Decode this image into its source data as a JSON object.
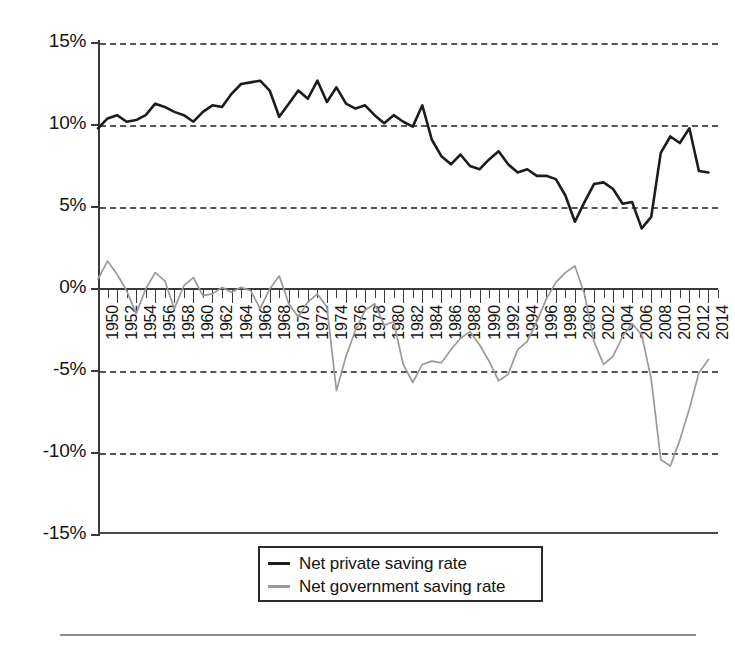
{
  "chart_data": {
    "type": "line",
    "title": "",
    "subtitle": "",
    "xlabel": "",
    "ylabel": "",
    "xlim": [
      1950,
      2015
    ],
    "ylim": [
      -15,
      15
    ],
    "y_tick_labels": [
      "15%",
      "10%",
      "5%",
      "0%",
      "-5%",
      "-10%",
      "-15%"
    ],
    "y_tick_values": [
      15,
      10,
      5,
      0,
      -5,
      -10,
      -15
    ],
    "grid": "horizontal-dashed",
    "gridlines_at": [
      15,
      10,
      5,
      -5,
      -10
    ],
    "zero_axis": 0,
    "legend_position": "below-center",
    "x_tick_labels": [
      "1950",
      "1952",
      "1954",
      "1956",
      "1958",
      "1960",
      "1962",
      "1964",
      "1966",
      "1968",
      "1970",
      "1972",
      "1974",
      "1976",
      "1978",
      "1980",
      "1982",
      "1984",
      "1986",
      "1988",
      "1990",
      "1992",
      "1994",
      "1996",
      "1998",
      "2000",
      "2002",
      "2004",
      "2006",
      "2008",
      "2010",
      "2012",
      "2014"
    ],
    "x_minor_tick_years": [
      1951,
      1953,
      1955,
      1957,
      1959,
      1961,
      1963,
      1965,
      1967,
      1969,
      1971,
      1973,
      1975,
      1977,
      1979,
      1981,
      1983,
      1985,
      1987,
      1989,
      1991,
      1993,
      1995,
      1997,
      1999,
      2001,
      2003,
      2005,
      2007,
      2009,
      2011,
      2013,
      2015
    ],
    "x": [
      1950,
      1951,
      1952,
      1953,
      1954,
      1955,
      1956,
      1957,
      1958,
      1959,
      1960,
      1961,
      1962,
      1963,
      1964,
      1965,
      1966,
      1967,
      1968,
      1969,
      1970,
      1971,
      1972,
      1973,
      1974,
      1975,
      1976,
      1977,
      1978,
      1979,
      1980,
      1981,
      1982,
      1983,
      1984,
      1985,
      1986,
      1987,
      1988,
      1989,
      1990,
      1991,
      1992,
      1993,
      1994,
      1995,
      1996,
      1997,
      1998,
      1999,
      2000,
      2001,
      2002,
      2003,
      2004,
      2005,
      2006,
      2007,
      2008,
      2009,
      2010,
      2011,
      2012,
      2013,
      2014
    ],
    "series": [
      {
        "name": "Net private saving rate",
        "color": "#1c1c1c",
        "values": [
          9.8,
          10.4,
          10.6,
          10.2,
          10.3,
          10.6,
          11.3,
          11.1,
          10.8,
          10.6,
          10.2,
          10.8,
          11.2,
          11.1,
          11.9,
          12.5,
          12.6,
          12.7,
          12.1,
          10.5,
          11.3,
          12.1,
          11.6,
          12.7,
          11.4,
          12.3,
          11.3,
          11.0,
          11.2,
          10.6,
          10.1,
          10.6,
          10.2,
          9.9,
          11.2,
          9.1,
          8.1,
          7.6,
          8.2,
          7.5,
          7.3,
          7.9,
          8.4,
          7.6,
          7.1,
          7.3,
          6.9,
          6.9,
          6.7,
          5.7,
          4.1,
          5.3,
          6.4,
          6.5,
          6.1,
          5.2,
          5.3,
          3.7,
          4.4,
          8.3,
          9.3,
          8.9,
          9.8,
          7.2,
          7.1
        ]
      },
      {
        "name": "Net government saving rate",
        "color": "#9a9a9a",
        "values": [
          0.6,
          1.7,
          0.9,
          -0.1,
          -1.5,
          0.0,
          1.0,
          0.5,
          -1.2,
          0.2,
          0.7,
          -0.4,
          -0.3,
          0.1,
          -0.2,
          0.1,
          -0.1,
          -1.2,
          0.0,
          0.8,
          -0.9,
          -1.7,
          -0.8,
          -0.3,
          -1.1,
          -6.2,
          -4.1,
          -2.5,
          -1.3,
          -0.9,
          -2.2,
          -2.0,
          -4.6,
          -5.7,
          -4.6,
          -4.4,
          -4.5,
          -3.7,
          -3.0,
          -2.6,
          -3.4,
          -4.4,
          -5.6,
          -5.2,
          -3.7,
          -3.2,
          -2.0,
          -0.6,
          0.4,
          1.0,
          1.4,
          -0.3,
          -3.2,
          -4.6,
          -4.1,
          -2.9,
          -2.1,
          -2.8,
          -5.5,
          -10.4,
          -10.8,
          -9.2,
          -7.3,
          -5.1,
          -4.3
        ]
      }
    ]
  },
  "legend": {
    "items": [
      {
        "label": "Net private saving rate",
        "marker": "line-dark"
      },
      {
        "label": "Net government saving rate",
        "marker": "line-gray"
      }
    ]
  }
}
